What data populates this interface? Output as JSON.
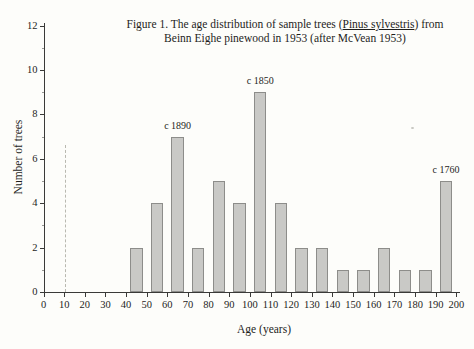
{
  "figure": {
    "title_line1_prefix": "Figure 1. The age distribution of sample trees (",
    "title_species": "Pinus sylvestris",
    "title_line1_suffix": ") from",
    "title_line2": "Beinn Eighe pinewood in 1953 (after McVean 1953)"
  },
  "chart_data": {
    "type": "bar",
    "title": "Figure 1. The age distribution of sample trees (Pinus sylvestris) from Beinn Eighe pinewood in 1953 (after McVean 1953)",
    "xlabel": "Age (years)",
    "ylabel": "Number of trees",
    "categories": [
      45,
      55,
      65,
      75,
      85,
      95,
      105,
      115,
      125,
      135,
      145,
      155,
      165,
      175,
      185,
      195
    ],
    "values": [
      2,
      4,
      7,
      2,
      5,
      4,
      9,
      4,
      2,
      2,
      1,
      1,
      2,
      1,
      1,
      5
    ],
    "bar_width_years": 6,
    "xlim": [
      0,
      200
    ],
    "ylim": [
      0,
      12
    ],
    "x_tick_step": 10,
    "y_tick_step": 2,
    "y_minor_tick_step": 1,
    "x_tick_labels": [
      "0",
      "10",
      "20",
      "30",
      "40",
      "50",
      "60",
      "70",
      "80",
      "90",
      "100",
      "110",
      "120",
      "130",
      "140",
      "150",
      "160",
      "170",
      "180",
      "190",
      "200"
    ],
    "y_tick_labels": [
      "0",
      "2",
      "4",
      "6",
      "8",
      "10",
      "12"
    ],
    "grid": false,
    "legend": null,
    "annotations": [
      {
        "text": "c 1890",
        "age": 65,
        "value": 7
      },
      {
        "text": "c 1850",
        "age": 105,
        "value": 9
      },
      {
        "text": "c 1760",
        "age": 195,
        "value": 5
      }
    ],
    "reference_line": {
      "age": 10.5,
      "from_value": 0,
      "to_value": 6.6,
      "style": "dashed"
    },
    "colors": {
      "bar_fill": "#c9c9c6",
      "bar_border": "#8d8d8a",
      "axis": "#3a3a38",
      "text": "#1e1e1c",
      "reference_line": "#b9b9b0",
      "background": "#fdfdfa"
    }
  }
}
